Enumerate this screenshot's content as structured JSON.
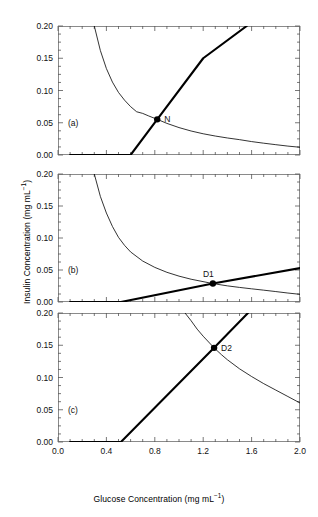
{
  "figure": {
    "xlabel_main": "Glucose Concentration (mg mL",
    "xlabel_sup": "−1",
    "xlabel_tail": ")",
    "ylabel_main": "Insulin Concentration (mg mL",
    "ylabel_sup": "−1",
    "ylabel_tail": ")"
  },
  "chart_data": {
    "type": "line",
    "title": "",
    "xlabel": "Glucose Concentration (mg mL−1)",
    "ylabel": "Insulin Concentration (mg mL−1)",
    "xlim": [
      0.0,
      2.0
    ],
    "ylim": [
      0.0,
      0.2
    ],
    "xticks": [
      0.0,
      0.4,
      0.8,
      1.2,
      1.6,
      2.0
    ],
    "xtick_labels": [
      "0.0",
      "0.4",
      "0.8",
      "1.2",
      "1.6",
      "2.0"
    ],
    "yticks": [
      0.0,
      0.05,
      0.1,
      0.15,
      0.2
    ],
    "ytick_labels": [
      "0.00",
      "0.05",
      "0.10",
      "0.15",
      "0.20"
    ],
    "x_minor_interval": 0.1,
    "y_minor_interval": 0.0125,
    "grid": false,
    "legend": null,
    "panels": [
      {
        "tag": "(a)",
        "series": [
          {
            "name": "glucose-removal-curve",
            "style": "thin",
            "comment": "decreasing hyperbola",
            "points": [
              [
                0.3,
                0.2
              ],
              [
                0.35,
                0.162
              ],
              [
                0.4,
                0.134
              ],
              [
                0.45,
                0.113
              ],
              [
                0.5,
                0.097
              ],
              [
                0.55,
                0.085
              ],
              [
                0.6,
                0.075
              ],
              [
                0.65,
                0.067
              ],
              [
                0.7,
                0.0645
              ],
              [
                0.75,
                0.0605
              ],
              [
                0.82,
                0.0553
              ],
              [
                0.9,
                0.049
              ],
              [
                1.0,
                0.0425
              ],
              [
                1.1,
                0.0372
              ],
              [
                1.2,
                0.0329
              ],
              [
                1.3,
                0.0294
              ],
              [
                1.4,
                0.0264
              ],
              [
                1.5,
                0.0238
              ],
              [
                1.6,
                0.0208
              ],
              [
                1.7,
                0.0183
              ],
              [
                1.8,
                0.016
              ],
              [
                1.9,
                0.0138
              ],
              [
                2.0,
                0.012
              ]
            ]
          },
          {
            "name": "insulin-secretion-line",
            "style": "thick",
            "comment": "zero then linear rise",
            "points": [
              [
                0.1,
                0.0
              ],
              [
                0.6,
                0.0
              ],
              [
                0.82,
                0.0553
              ],
              [
                1.2,
                0.15
              ],
              [
                1.56,
                0.2
              ]
            ]
          }
        ],
        "intersection": {
          "label": "N",
          "x": 0.82,
          "y": 0.0553
        }
      },
      {
        "tag": "(b)",
        "series": [
          {
            "name": "glucose-removal-curve",
            "style": "thin",
            "comment": "decreasing hyperbola",
            "points": [
              [
                0.3,
                0.2
              ],
              [
                0.35,
                0.165
              ],
              [
                0.4,
                0.139
              ],
              [
                0.45,
                0.118
              ],
              [
                0.5,
                0.101
              ],
              [
                0.55,
                0.0885
              ],
              [
                0.6,
                0.0782
              ],
              [
                0.7,
                0.064
              ],
              [
                0.8,
                0.0541
              ],
              [
                0.9,
                0.0464
              ],
              [
                1.0,
                0.0404
              ],
              [
                1.1,
                0.0356
              ],
              [
                1.28,
                0.0288
              ],
              [
                1.4,
                0.0252
              ],
              [
                1.5,
                0.0228
              ],
              [
                1.6,
                0.0206
              ],
              [
                1.7,
                0.0185
              ],
              [
                1.8,
                0.0163
              ],
              [
                1.9,
                0.014
              ],
              [
                2.0,
                0.012
              ]
            ]
          },
          {
            "name": "insulin-secretion-line",
            "style": "thick",
            "comment": "zero then shallow linear rise",
            "points": [
              [
                0.1,
                0.0
              ],
              [
                0.52,
                0.0
              ],
              [
                1.28,
                0.0288
              ],
              [
                2.0,
                0.053
              ]
            ]
          }
        ],
        "intersection": {
          "label": "D1",
          "x": 1.28,
          "y": 0.0288
        }
      },
      {
        "tag": "(c)",
        "series": [
          {
            "name": "glucose-removal-curve",
            "style": "thin",
            "comment": "decreasing hyperbola shifted right",
            "points": [
              [
                1.05,
                0.2
              ],
              [
                1.1,
                0.188
              ],
              [
                1.15,
                0.175
              ],
              [
                1.2,
                0.164
              ],
              [
                1.29,
                0.146
              ],
              [
                1.35,
                0.1355
              ],
              [
                1.4,
                0.1275
              ],
              [
                1.5,
                0.1135
              ],
              [
                1.6,
                0.1015
              ],
              [
                1.7,
                0.0905
              ],
              [
                1.8,
                0.0805
              ],
              [
                1.9,
                0.0705
              ],
              [
                2.0,
                0.0605
              ]
            ]
          },
          {
            "name": "insulin-secretion-line",
            "style": "thick",
            "comment": "zero then steep linear rise",
            "points": [
              [
                0.1,
                0.0
              ],
              [
                0.52,
                0.0
              ],
              [
                1.29,
                0.146
              ],
              [
                1.57,
                0.2
              ]
            ]
          }
        ],
        "intersection": {
          "label": "D2",
          "x": 1.29,
          "y": 0.146
        }
      }
    ]
  }
}
